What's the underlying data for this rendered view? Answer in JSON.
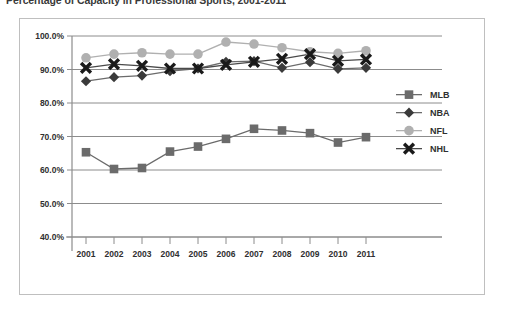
{
  "chart_data": {
    "type": "line",
    "title": "Percentage of Capacity in Professional Sports, 2001-2011",
    "xlabel": "",
    "ylabel": "",
    "categories": [
      "2001",
      "2002",
      "2003",
      "2004",
      "2005",
      "2006",
      "2007",
      "2008",
      "2009",
      "2010",
      "2011"
    ],
    "x": [
      2001,
      2002,
      2003,
      2004,
      2005,
      2006,
      2007,
      2008,
      2009,
      2010,
      2011
    ],
    "ylim": [
      40.0,
      100.0
    ],
    "ytick_values": [
      40.0,
      50.0,
      60.0,
      70.0,
      80.0,
      90.0,
      100.0
    ],
    "ytick_labels": [
      "40.0%",
      "50.0%",
      "60.0%",
      "70.0%",
      "80.0%",
      "90.0%",
      "100.0%"
    ],
    "grid": true,
    "legend_position": "right",
    "series": [
      {
        "name": "MLB",
        "marker": "square",
        "color": "#6b6b6b",
        "line_color": "#6b6b6b",
        "values": [
          65.3,
          60.3,
          60.6,
          65.5,
          67.0,
          69.3,
          72.3,
          71.8,
          71.0,
          68.2,
          69.8
        ]
      },
      {
        "name": "NBA",
        "marker": "diamond",
        "color": "#3a3a3a",
        "line_color": "#6b6b6b",
        "values": [
          86.5,
          87.7,
          88.2,
          89.5,
          90.3,
          92.3,
          92.5,
          90.5,
          92.2,
          90.2,
          90.5
        ]
      },
      {
        "name": "NFL",
        "marker": "circle",
        "color": "#b0b0b0",
        "line_color": "#b0b0b0",
        "values": [
          93.5,
          94.6,
          95.0,
          94.6,
          94.6,
          98.2,
          97.6,
          96.5,
          95.3,
          94.8,
          95.6
        ]
      },
      {
        "name": "NHL",
        "marker": "cross",
        "color": "#1a1a1a",
        "line_color": "#4a4a4a",
        "values": [
          90.5,
          91.6,
          91.1,
          90.3,
          90.3,
          91.4,
          92.3,
          93.2,
          94.6,
          92.6,
          93.0
        ]
      }
    ],
    "legend_entries": [
      "MLB",
      "NBA",
      "NFL",
      "NHL"
    ],
    "colors": {
      "mlb": "#6b6b6b",
      "nba": "#3a3a3a",
      "nfl": "#b0b0b0",
      "nhl": "#1a1a1a",
      "grid": "#8c8c8c",
      "frame": "#bfbfbf",
      "text": "#2f2f2f",
      "background": "#ffffff"
    }
  }
}
